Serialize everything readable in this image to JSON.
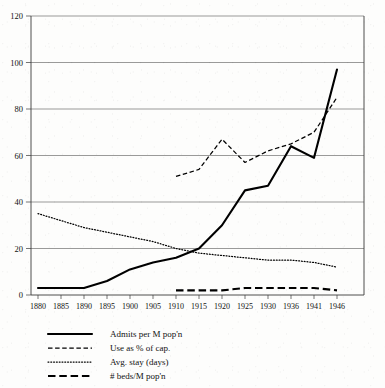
{
  "chart_data": {
    "type": "line",
    "title": "",
    "subtitle": "",
    "xlabel": "",
    "ylabel": "",
    "grid": true,
    "legend_position": "below",
    "xlim": [
      1880,
      1946
    ],
    "ylim": [
      0,
      120
    ],
    "yticks": [
      0,
      20,
      40,
      60,
      80,
      100,
      120
    ],
    "xticks": [
      1880,
      1885,
      1890,
      1895,
      1900,
      1905,
      1910,
      1915,
      1920,
      1925,
      1930,
      1936,
      1941,
      1946
    ],
    "x": [
      1880,
      1885,
      1890,
      1895,
      1900,
      1905,
      1910,
      1915,
      1920,
      1925,
      1930,
      1936,
      1941,
      1946
    ],
    "series": [
      {
        "name": "Admits per M pop'n",
        "style": "solid",
        "x": [
          1880,
          1885,
          1890,
          1895,
          1900,
          1905,
          1910,
          1915,
          1920,
          1925,
          1930,
          1936,
          1941,
          1946
        ],
        "values": [
          3,
          3,
          3,
          6,
          11,
          14,
          16,
          20,
          30,
          45,
          47,
          64,
          59,
          97
        ]
      },
      {
        "name": "Use as % of cap.",
        "style": "dashed",
        "x": [
          1910,
          1915,
          1920,
          1925,
          1930,
          1936,
          1941,
          1946
        ],
        "values": [
          51,
          54,
          67,
          57,
          62,
          65,
          70,
          85
        ]
      },
      {
        "name": "Avg. stay (days)",
        "style": "dotted",
        "x": [
          1880,
          1885,
          1890,
          1895,
          1900,
          1905,
          1910,
          1915,
          1920,
          1925,
          1930,
          1936,
          1941,
          1946
        ],
        "values": [
          35,
          32,
          29,
          27,
          25,
          23,
          20,
          18,
          17,
          16,
          15,
          15,
          14,
          12
        ]
      },
      {
        "name": "# beds/M pop'n",
        "style": "long-dashed",
        "x": [
          1910,
          1915,
          1920,
          1925,
          1930,
          1936,
          1941,
          1946
        ],
        "values": [
          2,
          2,
          2,
          3,
          3,
          3,
          3,
          2
        ]
      }
    ]
  },
  "axes": {
    "y_tick_labels": [
      "0",
      "20",
      "40",
      "60",
      "80",
      "100",
      "120"
    ],
    "x_tick_labels": [
      "1880",
      "1885",
      "1890",
      "1895",
      "1900",
      "1905",
      "1910",
      "1915",
      "1920",
      "1925",
      "1930",
      "1936",
      "1941",
      "1946"
    ]
  },
  "legend": {
    "items": [
      {
        "label": "Admits per M pop'n",
        "style": "solid"
      },
      {
        "label": "Use as % of cap.",
        "style": "dashed"
      },
      {
        "label": "Avg. stay (days)",
        "style": "dotted"
      },
      {
        "label": "# beds/M pop'n",
        "style": "long-dashed"
      }
    ]
  },
  "colors": {
    "ink": "#000000",
    "grid": "#6e6e6e",
    "background": "#fdfdfc"
  }
}
